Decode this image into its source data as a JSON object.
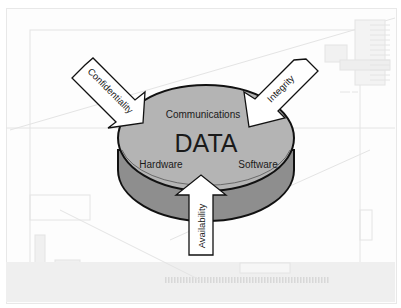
{
  "diagram": {
    "center_label": "DATA",
    "components": [
      {
        "label": "Communications"
      },
      {
        "label": "Hardware"
      },
      {
        "label": "Software"
      }
    ],
    "arrows": [
      {
        "label": "Confidentiality",
        "direction": "from-upper-left"
      },
      {
        "label": "Integrity",
        "direction": "from-upper-right"
      },
      {
        "label": "Availability",
        "direction": "from-below"
      }
    ],
    "colors": {
      "disk_top": "#b4b4b4",
      "disk_side": "#8e8e8e",
      "arrow_fill": "#ffffff",
      "outline": "#111111",
      "background_lines": "#e6e6e6"
    }
  }
}
